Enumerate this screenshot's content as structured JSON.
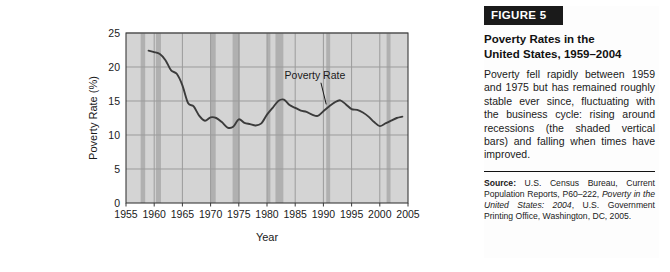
{
  "figure": {
    "banner_label": "FIGURE 5",
    "title_line1": "Poverty Rates in the",
    "title_line2": "United States, 1959–2004",
    "body": "Poverty fell rapidly between 1959 and 1975 but has remained roughly stable ever since, fluctuating with the business cycle: rising around recessions (the shaded vertical bars) and falling when times have improved.",
    "source_label": "Source:",
    "source_text_1": " U.S. Census Bureau, Current Population Reports, P60–222, ",
    "source_text_italic": "Poverty in the United States: 2004",
    "source_text_2": ", U.S. Government Printing Office, Washington, DC, 2005."
  },
  "chart_data": {
    "type": "line",
    "title": "",
    "xlabel": "Year",
    "ylabel": "Poverty Rate (%)",
    "xlim": [
      1955,
      2005
    ],
    "ylim": [
      0,
      25
    ],
    "xticks": [
      1955,
      1960,
      1965,
      1970,
      1975,
      1980,
      1985,
      1990,
      1995,
      2000,
      2005
    ],
    "yticks": [
      0,
      5,
      10,
      15,
      20,
      25
    ],
    "grid": true,
    "legend_position": "none",
    "annotations": [
      {
        "text": "Poverty Rate",
        "x": 1988.5,
        "y": 18.2,
        "leader_to_x": 1990.5,
        "leader_to_y": 14.5
      }
    ],
    "series": [
      {
        "name": "Poverty Rate",
        "color": "#3b3b3b",
        "x": [
          1959,
          1960,
          1961,
          1962,
          1963,
          1964,
          1965,
          1966,
          1967,
          1968,
          1969,
          1970,
          1971,
          1972,
          1973,
          1974,
          1975,
          1976,
          1977,
          1978,
          1979,
          1980,
          1981,
          1982,
          1983,
          1984,
          1985,
          1986,
          1987,
          1988,
          1989,
          1990,
          1991,
          1992,
          1993,
          1994,
          1995,
          1996,
          1997,
          1998,
          1999,
          2000,
          2001,
          2002,
          2003,
          2004
        ],
        "values": [
          22.4,
          22.2,
          21.9,
          21.0,
          19.5,
          19.0,
          17.3,
          14.7,
          14.2,
          12.8,
          12.1,
          12.6,
          12.5,
          11.9,
          11.1,
          11.2,
          12.3,
          11.8,
          11.6,
          11.4,
          11.7,
          13.0,
          14.0,
          15.0,
          15.2,
          14.4,
          14.0,
          13.6,
          13.4,
          13.0,
          12.8,
          13.5,
          14.2,
          14.8,
          15.1,
          14.5,
          13.8,
          13.7,
          13.3,
          12.7,
          11.9,
          11.3,
          11.7,
          12.1,
          12.5,
          12.7
        ]
      }
    ],
    "recession_bands": [
      {
        "start": 1957.6,
        "end": 1958.4
      },
      {
        "start": 1960.3,
        "end": 1961.2
      },
      {
        "start": 1969.9,
        "end": 1970.9
      },
      {
        "start": 1973.9,
        "end": 1975.2
      },
      {
        "start": 1980.0,
        "end": 1980.6
      },
      {
        "start": 1981.5,
        "end": 1982.9
      },
      {
        "start": 1990.5,
        "end": 1991.2
      },
      {
        "start": 2001.2,
        "end": 2001.9
      }
    ],
    "colors": {
      "plot_background": "#d4d4d4",
      "recession_band": "#b0b0b0",
      "gridline": "#9b9b9b",
      "line": "#3b3b3b",
      "axis": "#3a3a3a",
      "banner_background": "#1a1a1a",
      "banner_text": "#ffffff"
    }
  }
}
